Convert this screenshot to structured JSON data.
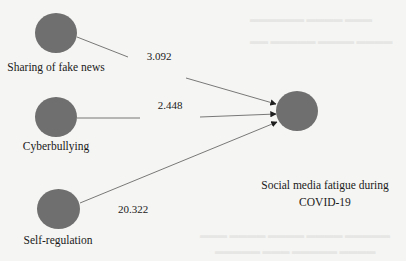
{
  "diagram": {
    "type": "path-model",
    "colors": {
      "node_fill": "#6f6f6f",
      "edge": "#6a6a6a",
      "text": "#1a1a1a",
      "background": "#f5f5f3"
    },
    "nodes": [
      {
        "id": "sharing",
        "label": "Sharing of fake news"
      },
      {
        "id": "cyberbullying",
        "label": "Cyberbullying"
      },
      {
        "id": "selfreg",
        "label": "Self-regulation"
      },
      {
        "id": "fatigue",
        "label_line1": "Social media fatigue during",
        "label_line2": "COVID-19"
      }
    ],
    "edges": [
      {
        "from": "sharing",
        "to": "fatigue",
        "value": "3.092"
      },
      {
        "from": "cyberbullying",
        "to": "fatigue",
        "value": "2.448"
      },
      {
        "from": "selfreg",
        "to": "fatigue",
        "value": "20.322"
      }
    ]
  }
}
